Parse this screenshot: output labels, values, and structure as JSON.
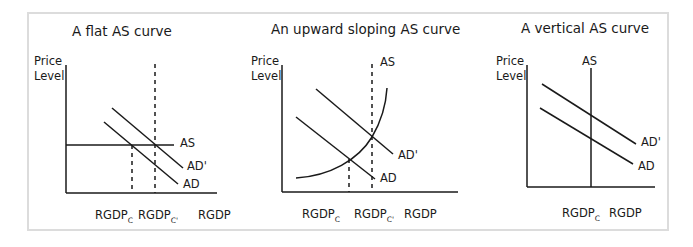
{
  "panels": [
    {
      "title": "A flat AS curve",
      "y_label_line1": "Price",
      "y_label_line2": "Level",
      "curve_labels": {
        "as": "AS",
        "ad_shifted": "AD'",
        "ad": "AD"
      },
      "x_labels": {
        "rgdp_c": "RGDP",
        "rgdp_c_sub": "C",
        "rgdp_c2": "RGDP",
        "rgdp_c2_sub": "C'",
        "rgdp": "RGDP"
      }
    },
    {
      "title": "An upward sloping AS curve",
      "y_label_line1": "Price",
      "y_label_line2": "Level",
      "curve_labels": {
        "as": "AS",
        "ad_shifted": "AD'",
        "ad": "AD"
      },
      "x_labels": {
        "rgdp_c": "RGDP",
        "rgdp_c_sub": "C",
        "rgdp_c2": "RGDP",
        "rgdp_c2_sub": "C'",
        "rgdp": "RGDP"
      }
    },
    {
      "title": "A vertical AS curve",
      "y_label_line1": "Price",
      "y_label_line2": "Level",
      "curve_labels": {
        "as": "AS",
        "ad_shifted": "AD'",
        "ad": "AD"
      },
      "x_labels": {
        "rgdp_c": "RGDP",
        "rgdp_c_sub": "C",
        "rgdp": "RGDP"
      }
    }
  ],
  "colors": {
    "line": "#1a1a1a",
    "frame": "#dcdcdc",
    "background": "#ffffff"
  }
}
